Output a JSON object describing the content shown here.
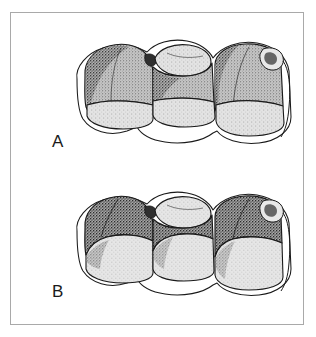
{
  "figure": {
    "type": "scientific-line-illustration",
    "border_color": "#a9a9a9",
    "background_color": "#ffffff",
    "ink_color": "#1a1a1a",
    "enamel_fill": "#b4b4b4",
    "dentin_fill": "#d8d8d8",
    "highlight_fill": "#ffffff",
    "panels": [
      {
        "id": "a",
        "label": "A",
        "caption": "",
        "description": "Three molars with shallow, nearly level cervical margins; crowns broad, roots largely concealed.",
        "tooth_count": 3,
        "crown_shading": "stipple",
        "gingival_scallop": "shallow"
      },
      {
        "id": "b",
        "label": "B",
        "caption": "",
        "description": "Same three molars with deeply scalloped cervical margins exposing tall, stippled root surfaces.",
        "tooth_count": 3,
        "crown_shading": "stipple",
        "gingival_scallop": "deep"
      }
    ]
  }
}
